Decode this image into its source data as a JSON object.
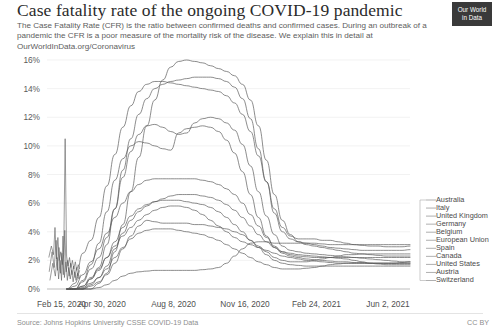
{
  "header": {
    "title": "Case fatality rate of the ongoing COVID-19 pandemic",
    "subtitle": "The Case Fatality Rate (CFR) is the ratio between confirmed deaths and confirmed cases. During an outbreak of a pandemic the CFR is a poor measure of the mortality risk of the disease. We explain this in detail at OurWorldInData.org/Coronavirus",
    "logo_line1": "Our World",
    "logo_line2": "in Data"
  },
  "footer": {
    "source": "Source: Johns Hopkins University CSSE COVID-19 Data",
    "license": "CC BY"
  },
  "chart_data": {
    "type": "line",
    "title": "Case fatality rate of the ongoing COVID-19 pandemic",
    "xlabel": "",
    "ylabel": "",
    "ylim": [
      0,
      16
    ],
    "ytick_labels": [
      "0%",
      "2%",
      "4%",
      "6%",
      "8%",
      "10%",
      "12%",
      "14%",
      "16%"
    ],
    "ytick_values": [
      0,
      2,
      4,
      6,
      8,
      10,
      12,
      14,
      16
    ],
    "xtick_labels": [
      "Feb 15, 2020",
      "Apr 30, 2020",
      "Aug 8, 2020",
      "Nov 16, 2020",
      "Feb 24, 2021",
      "Jun 2, 2021"
    ],
    "xtick_positions": [
      0,
      0.1515,
      0.3485,
      0.5455,
      0.7424,
      0.9394
    ],
    "grid": true,
    "legend_position": "right",
    "line_color": "#5a5a5a",
    "series": [
      {
        "name": "Belgium",
        "values": [
          0,
          0,
          0,
          0,
          0.4,
          1.1,
          2.6,
          4.5,
          6.8,
          9.2,
          11.4,
          13.2,
          14.6,
          15.5,
          15.9,
          16.0,
          15.9,
          15.8,
          15.6,
          15.4,
          15.2,
          14.9,
          14.3,
          13.2,
          11.4,
          9.0,
          6.6,
          4.8,
          3.8,
          3.3,
          3.1,
          3.0,
          2.9,
          2.8,
          2.7,
          2.6,
          2.5,
          2.45,
          2.4,
          2.35,
          2.3,
          2.3,
          2.3,
          2.3
        ]
      },
      {
        "name": "Italy",
        "values": [
          0,
          0.4,
          2.5,
          3.4,
          5.0,
          7.2,
          9.4,
          11.3,
          12.8,
          13.8,
          14.3,
          14.5,
          14.5,
          14.4,
          14.3,
          14.2,
          14.1,
          14.0,
          13.9,
          13.8,
          13.5,
          13.0,
          12.2,
          11.0,
          9.3,
          7.5,
          5.6,
          4.3,
          3.7,
          3.5,
          3.5,
          3.5,
          3.4,
          3.4,
          3.3,
          3.2,
          3.1,
          3.05,
          3.0,
          3.0,
          2.95,
          2.95,
          2.95,
          3.0
        ]
      },
      {
        "name": "United Kingdom",
        "values": [
          0,
          0,
          0,
          0.7,
          1.5,
          3.1,
          5.6,
          8.3,
          10.5,
          12.2,
          13.3,
          14.0,
          14.3,
          14.5,
          14.6,
          14.7,
          14.8,
          14.8,
          14.8,
          14.7,
          14.5,
          14.1,
          13.3,
          11.9,
          9.8,
          7.5,
          5.3,
          4.0,
          3.5,
          3.3,
          3.2,
          3.1,
          3.0,
          2.9,
          2.85,
          2.8,
          2.75,
          2.7,
          2.7,
          2.7,
          2.7,
          2.7,
          2.7,
          2.75
        ]
      },
      {
        "name": "France",
        "values": [
          0,
          0,
          0.5,
          1.4,
          2.2,
          3.6,
          5.6,
          7.8,
          9.6,
          10.8,
          11.4,
          11.5,
          11.3,
          11.0,
          10.8,
          10.9,
          11.6,
          11.9,
          12.0,
          11.9,
          11.6,
          11.1,
          10.1,
          8.6,
          6.8,
          5.1,
          3.8,
          3.0,
          2.7,
          2.6,
          2.5,
          2.45,
          2.4,
          2.35,
          2.3,
          2.25,
          2.2,
          2.15,
          2.1,
          2.05,
          2.0,
          1.95,
          1.9,
          1.9
        ]
      },
      {
        "name": "Spain",
        "values": [
          0,
          0,
          0.6,
          1.7,
          3.2,
          5.4,
          7.6,
          9.1,
          10.0,
          10.3,
          10.2,
          10.0,
          9.8,
          9.7,
          10.9,
          11.2,
          11.3,
          11.4,
          11.3,
          11.0,
          10.4,
          9.5,
          8.2,
          6.6,
          5.0,
          3.7,
          2.9,
          2.5,
          2.3,
          2.2,
          2.1,
          2.05,
          2.0,
          1.95,
          1.9,
          1.9,
          1.85,
          1.85,
          1.8,
          1.8,
          1.8,
          1.8,
          1.85,
          1.9
        ]
      },
      {
        "name": "European Union",
        "values": [
          0,
          0.2,
          1.0,
          1.9,
          2.8,
          3.9,
          5.0,
          6.0,
          6.8,
          7.3,
          7.6,
          7.7,
          7.7,
          7.7,
          7.7,
          7.7,
          7.7,
          7.6,
          7.5,
          7.3,
          7.0,
          6.6,
          6.0,
          5.2,
          4.4,
          3.6,
          3.0,
          2.6,
          2.4,
          2.3,
          2.25,
          2.2,
          2.2,
          2.2,
          2.2,
          2.2,
          2.2,
          2.2,
          2.2,
          2.2,
          2.2,
          2.2,
          2.2,
          2.2
        ]
      },
      {
        "name": "Germany",
        "values": [
          0,
          0,
          0,
          0.2,
          0.5,
          1.0,
          1.8,
          2.8,
          3.7,
          4.4,
          4.8,
          4.7,
          4.6,
          4.6,
          4.6,
          4.6,
          4.5,
          4.5,
          4.4,
          4.3,
          4.2,
          4.0,
          3.8,
          3.4,
          3.0,
          2.6,
          2.2,
          2.0,
          1.9,
          1.9,
          1.9,
          2.0,
          2.1,
          2.2,
          2.3,
          2.4,
          2.4,
          2.45,
          2.45,
          2.45,
          2.45,
          2.45,
          2.45,
          2.45
        ]
      },
      {
        "name": "Canada",
        "values": [
          0,
          0,
          0,
          0.3,
          0.8,
          1.6,
          2.8,
          3.9,
          4.8,
          5.4,
          5.8,
          6.1,
          6.3,
          6.5,
          6.6,
          6.6,
          6.6,
          6.5,
          6.4,
          6.2,
          5.9,
          5.5,
          5.0,
          4.4,
          3.8,
          3.3,
          2.9,
          2.6,
          2.5,
          2.4,
          2.35,
          2.3,
          2.25,
          2.2,
          2.15,
          2.1,
          2.0,
          1.9,
          1.8,
          1.75,
          1.7,
          1.7,
          1.7,
          1.7
        ]
      },
      {
        "name": "United States",
        "values": [
          0,
          0,
          0.2,
          0.8,
          1.4,
          2.2,
          3.0,
          3.7,
          4.3,
          4.8,
          5.2,
          5.5,
          5.7,
          5.8,
          5.8,
          5.7,
          5.5,
          5.2,
          4.8,
          4.4,
          4.0,
          3.6,
          3.3,
          3.1,
          2.9,
          2.7,
          2.5,
          2.3,
          2.2,
          2.1,
          2.0,
          1.95,
          1.9,
          1.85,
          1.8,
          1.8,
          1.8,
          1.8,
          1.8,
          1.8,
          1.8,
          1.8,
          1.8,
          1.8
        ]
      },
      {
        "name": "Switzerland",
        "values": [
          0,
          0,
          0.2,
          0.7,
          1.3,
          2.2,
          3.3,
          4.3,
          5.1,
          5.6,
          5.9,
          6.1,
          6.2,
          6.2,
          6.2,
          6.1,
          6.0,
          5.9,
          5.7,
          5.4,
          5.0,
          4.5,
          4.0,
          3.4,
          2.9,
          2.4,
          2.0,
          1.8,
          1.7,
          1.65,
          1.6,
          1.6,
          1.6,
          1.6,
          1.6,
          1.6,
          1.6,
          1.6,
          1.6,
          1.6,
          1.6,
          1.6,
          1.6,
          1.6
        ]
      },
      {
        "name": "Austria",
        "values": [
          0,
          0,
          0.1,
          0.4,
          0.8,
          1.4,
          2.2,
          2.9,
          3.5,
          3.9,
          4.1,
          4.2,
          4.2,
          4.2,
          4.1,
          4.0,
          3.9,
          3.8,
          3.6,
          3.4,
          3.1,
          2.8,
          2.5,
          2.2,
          1.9,
          1.7,
          1.5,
          1.4,
          1.4,
          1.4,
          1.45,
          1.5,
          1.6,
          1.7,
          1.75,
          1.8,
          1.8,
          1.8,
          1.8,
          1.8,
          1.8,
          1.8,
          1.8,
          1.8
        ]
      },
      {
        "name": "Australia",
        "values": [
          0,
          0,
          0,
          0,
          0.1,
          0.3,
          0.6,
          0.9,
          1.1,
          1.2,
          1.25,
          1.3,
          1.3,
          1.3,
          1.3,
          1.3,
          1.3,
          1.35,
          1.4,
          1.5,
          1.8,
          2.3,
          2.8,
          3.2,
          3.3,
          3.3,
          3.2,
          3.2,
          3.2,
          3.2,
          3.2,
          3.2,
          3.15,
          3.1,
          3.1,
          3.1,
          3.1,
          3.1,
          3.1,
          3.1,
          3.1,
          3.1,
          3.1,
          3.1
        ]
      }
    ],
    "early_noise_series": [
      {
        "name": "noise-spike-a",
        "x": [
          0.005,
          0.012,
          0.018,
          0.022,
          0.026,
          0.03,
          0.034,
          0.038,
          0.042,
          0.046,
          0.05,
          0.054,
          0.058,
          0.062,
          0.066,
          0.07,
          0.074,
          0.078,
          0.082,
          0.086,
          0.09
        ],
        "y": [
          2.2,
          3.0,
          2.4,
          4.3,
          2.1,
          3.6,
          2.0,
          2.6,
          1.7,
          2.4,
          10.5,
          2.3,
          1.6,
          2.2,
          1.5,
          2.0,
          1.4,
          1.9,
          1.3,
          1.7,
          1.4
        ]
      },
      {
        "name": "noise-spike-b",
        "x": [
          0.006,
          0.014,
          0.02,
          0.025,
          0.029,
          0.033,
          0.037,
          0.041,
          0.045,
          0.049,
          0.053,
          0.057,
          0.061,
          0.065,
          0.069,
          0.073,
          0.077,
          0.081,
          0.085,
          0.09
        ],
        "y": [
          1.2,
          2.6,
          1.5,
          3.4,
          1.3,
          2.9,
          1.1,
          2.5,
          1.0,
          4.1,
          1.2,
          2.0,
          0.9,
          1.8,
          1.0,
          1.6,
          0.8,
          1.5,
          0.9,
          1.3
        ]
      },
      {
        "name": "noise-spike-c",
        "x": [
          0.008,
          0.016,
          0.023,
          0.028,
          0.032,
          0.036,
          0.04,
          0.044,
          0.048,
          0.052,
          0.056,
          0.06,
          0.064,
          0.068,
          0.072,
          0.076,
          0.08,
          0.084,
          0.088,
          0.092
        ],
        "y": [
          0.6,
          1.8,
          0.9,
          2.2,
          0.7,
          2.0,
          0.6,
          3.7,
          0.8,
          1.9,
          0.6,
          1.5,
          0.7,
          1.3,
          0.5,
          1.2,
          0.6,
          1.1,
          0.7,
          1.0
        ]
      }
    ]
  },
  "legend": {
    "items": [
      {
        "label": "Australia"
      },
      {
        "label": "Italy"
      },
      {
        "label": "United Kingdom"
      },
      {
        "label": "Germany"
      },
      {
        "label": "Belgium"
      },
      {
        "label": "European Union"
      },
      {
        "label": "Spain"
      },
      {
        "label": "Canada"
      },
      {
        "label": "United States"
      },
      {
        "label": "Austria"
      },
      {
        "label": "Switzerland"
      }
    ]
  }
}
